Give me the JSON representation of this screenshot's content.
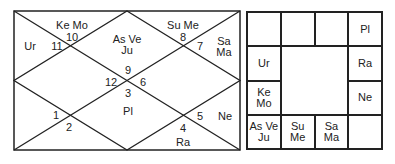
{
  "north_chart": {
    "houses": [
      {
        "sign": "10",
        "planets": "Ke Mo"
      },
      {
        "sign": "11",
        "planets": "Ur"
      },
      {
        "sign": "9",
        "planets": "As Ve Ju"
      },
      {
        "sign": "8",
        "planets": "Su Me"
      },
      {
        "sign": "7",
        "planets": "Sa Ma"
      },
      {
        "sign": "12",
        "planets": ""
      },
      {
        "sign": "6",
        "planets": ""
      },
      {
        "sign": "3",
        "planets": "Pl"
      },
      {
        "sign": "1",
        "planets": ""
      },
      {
        "sign": "2",
        "planets": ""
      },
      {
        "sign": "5",
        "planets": "Ne"
      },
      {
        "sign": "4",
        "planets": "Ra"
      }
    ],
    "labels": {
      "h10_planets": "Ke Mo",
      "h10_sign": "10",
      "h11_planets": "Ur",
      "h11_sign": "11",
      "h9_planets_l1": "As Ve",
      "h9_planets_l2": "Ju",
      "h9_sign": "9",
      "h8_planets": "Su Me",
      "h8_sign": "8",
      "h7_planets_l1": "Sa",
      "h7_planets_l2": "Ma",
      "h7_sign": "7",
      "h12_sign": "12",
      "h6_sign": "6",
      "h3_sign": "3",
      "h3_planets": "Pl",
      "h1_sign": "1",
      "h2_sign": "2",
      "h5_sign": "5",
      "h5_planets": "Ne",
      "h4_sign": "4",
      "h4_planets": "Ra"
    }
  },
  "south_chart": {
    "cells": [
      {
        "pos": "r1c1",
        "text": ""
      },
      {
        "pos": "r1c2",
        "text": ""
      },
      {
        "pos": "r1c3",
        "text": ""
      },
      {
        "pos": "r1c4",
        "text": "Pl"
      },
      {
        "pos": "r2c1",
        "text": "Ur"
      },
      {
        "pos": "r2c4",
        "text": "Ra"
      },
      {
        "pos": "r3c1",
        "text": "Ke Mo"
      },
      {
        "pos": "r3c4",
        "text": "Ne"
      },
      {
        "pos": "r4c1",
        "text_l1": "As Ve",
        "text_l2": "Ju"
      },
      {
        "pos": "r4c2",
        "text": "Su Me"
      },
      {
        "pos": "r4c3",
        "text": "Sa Ma"
      },
      {
        "pos": "r4c4",
        "text": ""
      }
    ]
  }
}
